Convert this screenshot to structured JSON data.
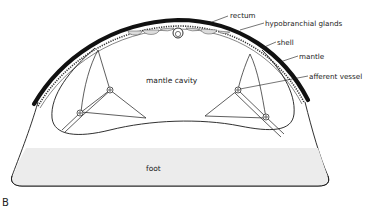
{
  "figure": {
    "panel_label": "B",
    "labels": {
      "rectum": "rectum",
      "hypobranchial_glands": "hypobranchial glands",
      "shell": "shell",
      "mantle": "mantle",
      "afferent_vessel": "afferent vessel",
      "mantle_cavity": "mantle cavity",
      "foot": "foot"
    }
  },
  "colors": {
    "ink": "#1a1a1a",
    "foot_fill": "#ececec",
    "background": "#ffffff"
  }
}
